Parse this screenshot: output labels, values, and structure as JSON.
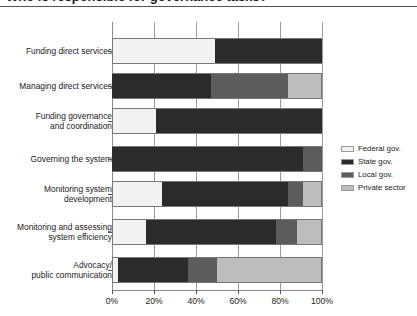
{
  "title": {
    "text": "Who is responsible for governance tasks?",
    "cut_off": true
  },
  "legend": {
    "position": "right",
    "items": [
      {
        "label": "Federal gov.",
        "color": "#f2f2f2",
        "name": "federal-gov"
      },
      {
        "label": "State gov.",
        "color": "#2b2b2b",
        "name": "state-gov"
      },
      {
        "label": "Local gov.",
        "color": "#5c5c5c",
        "name": "local-gov"
      },
      {
        "label": "Private sector",
        "color": "#bdbdbd",
        "name": "private-sector"
      }
    ]
  },
  "axis": {
    "x_ticks": [
      "0%",
      "20%",
      "40%",
      "60%",
      "80%",
      "100%"
    ],
    "x_tick_values": [
      0,
      20,
      40,
      60,
      80,
      100
    ]
  },
  "chart_data": {
    "type": "bar",
    "orientation": "horizontal",
    "stacked": true,
    "normalized": true,
    "title": "Who is responsible for governance tasks?",
    "xlabel": "",
    "ylabel": "",
    "xlim": [
      0,
      100
    ],
    "grid": true,
    "legend_position": "right",
    "categories": [
      "Funding direct services",
      "Managing direct services",
      "Funding governance and coordination",
      "Governing the system",
      "Monitoring system development",
      "Monitoring and assessing system efficiency",
      "Advocacy/ public communication"
    ],
    "category_labels_multiline": [
      [
        "Funding direct services"
      ],
      [
        "Managing direct services"
      ],
      [
        "Funding governance",
        "and coordination"
      ],
      [
        "Governing the system"
      ],
      [
        "Monitoring system",
        "development"
      ],
      [
        "Monitoring and assessing",
        "system efficiency"
      ],
      [
        "Advocacy/",
        "public communication"
      ]
    ],
    "series": [
      {
        "name": "Federal gov.",
        "color": "#f2f2f2",
        "values": [
          49,
          0,
          21,
          0,
          24,
          16,
          3
        ]
      },
      {
        "name": "State gov.",
        "color": "#2b2b2b",
        "values": [
          51,
          47,
          79,
          91,
          60,
          62,
          33
        ]
      },
      {
        "name": "Local gov.",
        "color": "#5c5c5c",
        "values": [
          0,
          37,
          0,
          9,
          7,
          10,
          14
        ]
      },
      {
        "name": "Private sector",
        "color": "#bdbdbd",
        "values": [
          0,
          16,
          0,
          0,
          9,
          12,
          50
        ]
      }
    ],
    "cumulative_breakpoints": [
      [
        49,
        100,
        100,
        100
      ],
      [
        0,
        47,
        84,
        100
      ],
      [
        21,
        100,
        100,
        100
      ],
      [
        0,
        91,
        100,
        100
      ],
      [
        24,
        84,
        91,
        100
      ],
      [
        16,
        78,
        88,
        100
      ],
      [
        3,
        36,
        50,
        100
      ]
    ]
  }
}
